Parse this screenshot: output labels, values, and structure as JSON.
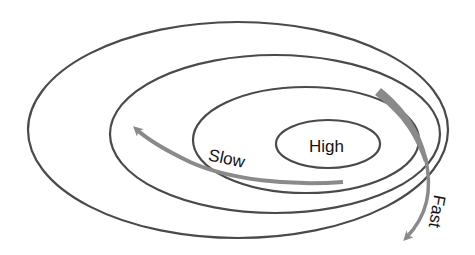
{
  "diagram": {
    "type": "nested-ellipses",
    "rings": [
      {
        "name": "outer",
        "cx": 238,
        "cy": 130,
        "rx": 210,
        "ry": 108
      },
      {
        "name": "second",
        "cx": 275,
        "cy": 134,
        "rx": 165,
        "ry": 79
      },
      {
        "name": "third",
        "cx": 306,
        "cy": 140,
        "rx": 113,
        "ry": 53
      },
      {
        "name": "inner",
        "cx": 328,
        "cy": 144,
        "rx": 52,
        "ry": 24
      }
    ],
    "labels": {
      "center": "High",
      "slow": "Slow",
      "fast": "Fast"
    },
    "colors": {
      "ring": "#4a4a4a",
      "arrow": "#8a8a8a",
      "text": "#111111",
      "background": "#ffffff"
    }
  }
}
